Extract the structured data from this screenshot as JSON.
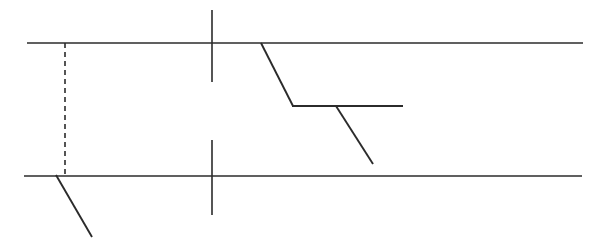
{
  "canvas": {
    "width": 605,
    "height": 248,
    "background_color": "#ffffff",
    "stroke_color": "#2b2b2b",
    "description": "Technical line drawing on plain white background"
  },
  "figure": {
    "title": "",
    "type": "line-drawing",
    "elements": [
      {
        "id": "top-rail",
        "name": "top-horizontal-line",
        "kind": "line",
        "style": "solid",
        "x1": 27,
        "y1": 43,
        "x2": 583,
        "y2": 43,
        "stroke_width": 1.6,
        "color": "#2b2b2b"
      },
      {
        "id": "bottom-rail",
        "name": "bottom-horizontal-line",
        "kind": "line",
        "style": "solid",
        "x1": 24,
        "y1": 176,
        "x2": 582,
        "y2": 176,
        "stroke_width": 1.6,
        "color": "#2b2b2b"
      },
      {
        "id": "dashed-connector",
        "name": "dashed-vertical-connector",
        "kind": "line",
        "style": "dashed",
        "dash_pattern": "5 4",
        "x1": 65,
        "y1": 43,
        "x2": 65,
        "y2": 176,
        "stroke_width": 1.6,
        "color": "#2b2b2b"
      },
      {
        "id": "upper-tick",
        "name": "upper-vertical-tick",
        "kind": "line",
        "style": "solid",
        "x1": 212,
        "y1": 10,
        "x2": 212,
        "y2": 82,
        "stroke_width": 1.6,
        "color": "#2b2b2b"
      },
      {
        "id": "lower-tick",
        "name": "lower-vertical-tick",
        "kind": "line",
        "style": "solid",
        "x1": 212,
        "y1": 140,
        "x2": 212,
        "y2": 215,
        "stroke_width": 1.6,
        "color": "#2b2b2b"
      },
      {
        "id": "left-branch",
        "name": "lower-left-diagonal-branch",
        "kind": "line",
        "style": "solid",
        "x1": 56,
        "y1": 175,
        "x2": 92,
        "y2": 237,
        "stroke_width": 1.9,
        "color": "#2b2b2b"
      },
      {
        "id": "center-diagonal-upper",
        "name": "center-upper-diagonal",
        "kind": "line",
        "style": "solid",
        "x1": 261,
        "y1": 43,
        "x2": 293,
        "y2": 106,
        "stroke_width": 1.9,
        "color": "#2b2b2b"
      },
      {
        "id": "center-shelf",
        "name": "center-horizontal-shelf",
        "kind": "line",
        "style": "solid",
        "x1": 292,
        "y1": 106,
        "x2": 403,
        "y2": 106,
        "stroke_width": 1.9,
        "color": "#2b2b2b"
      },
      {
        "id": "center-diagonal-lower",
        "name": "center-lower-diagonal",
        "kind": "line",
        "style": "solid",
        "x1": 336,
        "y1": 106,
        "x2": 373,
        "y2": 164,
        "stroke_width": 1.9,
        "color": "#2b2b2b"
      }
    ]
  },
  "labels": []
}
